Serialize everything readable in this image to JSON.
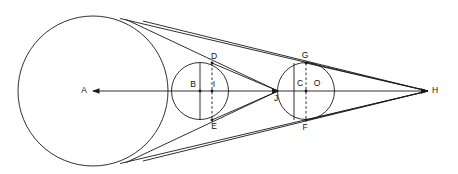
{
  "figure": {
    "type": "geometry-diagram",
    "background_color": "#ffffff",
    "stroke_color": "#1a1a1a",
    "canvas": {
      "width": 458,
      "height": 174
    },
    "baseline_y": 91
  },
  "labels": {
    "A": "A",
    "B": "B",
    "C": "C",
    "D": "D",
    "E": "E",
    "F": "F",
    "G": "G",
    "H": "H",
    "I": "I",
    "J": "J",
    "O": "O"
  },
  "points": [
    {
      "id": "A",
      "label": "A",
      "x": 93,
      "y": 91,
      "role": "center-large-circle",
      "label_dx": -9,
      "label_dy": 0
    },
    {
      "id": "B",
      "label": "B",
      "x": 200,
      "y": 91,
      "role": "center-middle-circle",
      "label_dx": -7,
      "label_dy": -4
    },
    {
      "id": "C",
      "label": "C",
      "x": 306,
      "y": 91,
      "role": "center-right-circle",
      "label_dx": -6,
      "label_dy": -5
    },
    {
      "id": "D",
      "label": "D",
      "x": 212,
      "y": 63,
      "role": "upper-dashed-chord-end-middle",
      "label_dx": 2,
      "label_dy": -4
    },
    {
      "id": "E",
      "label": "E",
      "x": 212,
      "y": 120,
      "role": "lower-dashed-chord-end-middle",
      "label_dx": 2,
      "label_dy": 9
    },
    {
      "id": "F",
      "label": "F",
      "x": 306,
      "y": 120,
      "role": "lower-dashed-chord-end-right",
      "label_dx": -1,
      "label_dy": 10
    },
    {
      "id": "G",
      "label": "G",
      "x": 306,
      "y": 63,
      "role": "upper-dashed-chord-end-right",
      "label_dx": -1,
      "label_dy": -5
    },
    {
      "id": "H",
      "label": "H",
      "x": 428,
      "y": 91,
      "role": "external-tangent-apex",
      "label_dx": 7,
      "label_dy": 0
    },
    {
      "id": "I",
      "label": "I",
      "x": 212,
      "y": 91,
      "role": "dashed-chord-midpoint-middle",
      "label_dx": 2,
      "label_dy": -4
    },
    {
      "id": "J",
      "label": "J",
      "x": 278,
      "y": 91,
      "role": "internal-tangent-apex",
      "label_dx": -2,
      "label_dy": 10
    },
    {
      "id": "O",
      "label": "O",
      "x": 316,
      "y": 91,
      "role": "dashed-chord-midpoint-right",
      "label_dx": 1,
      "label_dy": -5
    }
  ],
  "circles": [
    {
      "id": "large-circle",
      "center": "A",
      "cx": 93,
      "cy": 91,
      "r": 75
    },
    {
      "id": "middle-circle",
      "center": "B",
      "cx": 200,
      "cy": 91,
      "r": 28.5
    },
    {
      "id": "right-circle",
      "center": "C",
      "cx": 306,
      "cy": 91,
      "r": 28.5
    }
  ],
  "axis": {
    "id": "horizontal-axis",
    "from_x": 93,
    "to_x": 428,
    "y": 91,
    "left_arrow": true,
    "right_arrow": true,
    "mid_arrow_x": 278
  },
  "chords": [
    {
      "id": "solid-chord-B",
      "x": 200,
      "y1": 63,
      "y2": 120,
      "style": "solid"
    },
    {
      "id": "solid-chord-C",
      "x": 294,
      "y1": 63,
      "y2": 120,
      "style": "solid"
    },
    {
      "id": "dashed-chord-DE",
      "x": 212,
      "y1": 63,
      "y2": 120,
      "style": "dashed"
    },
    {
      "id": "dashed-chord-GF",
      "x": 306,
      "y1": 63,
      "y2": 120,
      "style": "dashed"
    }
  ],
  "tangent_lines": [
    {
      "id": "outer-tangent-upper-1",
      "x1": 140,
      "y1": 18,
      "x2": 428,
      "y2": 91,
      "kind": "external-upper"
    },
    {
      "id": "outer-tangent-upper-2",
      "x1": 140,
      "y1": 18,
      "x2": 428,
      "y2": 91,
      "kind": "external-upper-b"
    },
    {
      "id": "outer-tangent-lower-1",
      "x1": 140,
      "y1": 164,
      "x2": 428,
      "y2": 91,
      "kind": "external-lower"
    },
    {
      "id": "outer-tangent-lower-2",
      "x1": 140,
      "y1": 164,
      "x2": 428,
      "y2": 91,
      "kind": "external-lower-b"
    },
    {
      "id": "internal-tangent-upper",
      "x1": 140,
      "y1": 18,
      "x2": 278,
      "y2": 91,
      "kind": "internal-upper"
    },
    {
      "id": "internal-tangent-lower",
      "x1": 140,
      "y1": 164,
      "x2": 278,
      "y2": 91,
      "kind": "internal-lower"
    },
    {
      "id": "chord-D-to-J",
      "x1": 212,
      "y1": 63,
      "x2": 278,
      "y2": 91,
      "kind": "D-J"
    },
    {
      "id": "chord-E-to-J",
      "x1": 212,
      "y1": 120,
      "x2": 278,
      "y2": 91,
      "kind": "E-J"
    },
    {
      "id": "chord-G-to-H",
      "x1": 306,
      "y1": 63,
      "x2": 428,
      "y2": 91,
      "kind": "G-H"
    },
    {
      "id": "chord-F-to-H",
      "x1": 306,
      "y1": 120,
      "x2": 428,
      "y2": 91,
      "kind": "F-H"
    }
  ]
}
